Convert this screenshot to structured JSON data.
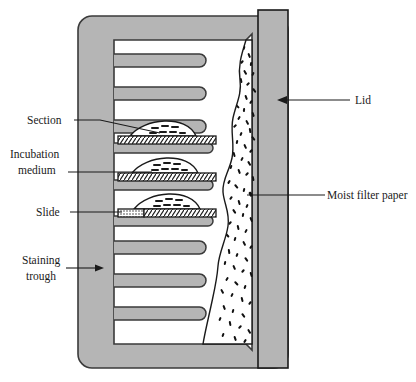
{
  "figure": {
    "type": "scientific-apparatus-diagram"
  },
  "colors": {
    "body_gray": "#b3b3b3",
    "body_gray_light": "#bfbfbf",
    "slot_white": "#ffffff",
    "outline": "#3a3a3a",
    "outline_dark": "#1a1a1a",
    "label_text": "#1a1a1a",
    "page_background": "#ffffff",
    "speckle": "#111111",
    "hatch": "#1a1a1a"
  },
  "labels": [
    {
      "id": "section",
      "text": "Section",
      "side": "left",
      "leader": "line",
      "text_x": 27,
      "text_y": 123
    },
    {
      "id": "incubation-medium",
      "text_line_1": "Incubation",
      "text_line_2": "medium",
      "text": "Incubation medium",
      "side": "left",
      "leader": "line",
      "text_x": 10,
      "text_y": 160
    },
    {
      "id": "slide",
      "text": "Slide",
      "side": "left",
      "leader": "line",
      "text_x": 36,
      "text_y": 211
    },
    {
      "id": "staining-trough",
      "text_line_1": "Staining",
      "text_line_2": "trough",
      "text": "Staining trough",
      "side": "left",
      "leader": "arrow",
      "text_x": 22,
      "text_y": 262
    },
    {
      "id": "lid",
      "text": "Lid",
      "side": "right",
      "leader": "arrow",
      "text_x": 355,
      "text_y": 102
    },
    {
      "id": "moist-filter-paper",
      "text": "Moist filter paper",
      "side": "right",
      "leader": "line",
      "text_x": 327,
      "text_y": 195
    }
  ],
  "apparatus": {
    "trough": {
      "name": "Staining trough",
      "x": 78,
      "y": 16,
      "width": 210,
      "height": 352,
      "corner_radius": 14
    },
    "chamber": {
      "name": "Interior chamber",
      "x": 114,
      "y": 40,
      "width": 140,
      "height": 304
    },
    "lid": {
      "name": "Lid",
      "x": 258,
      "y": 8,
      "width": 32,
      "height": 360
    },
    "filter_paper": {
      "name": "Moist filter paper",
      "description": "wavy speckled vertical band at right of chamber",
      "speckle_count": 150
    },
    "slot_count": 10,
    "slide_count": 3,
    "slides": [
      {
        "index": 1,
        "y": 136,
        "has_frosted_end": false
      },
      {
        "index": 2,
        "y": 173,
        "has_frosted_end": false
      },
      {
        "index": 3,
        "y": 209,
        "has_frosted_end": true
      }
    ]
  }
}
